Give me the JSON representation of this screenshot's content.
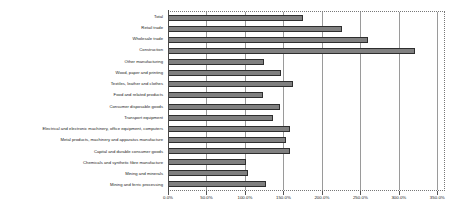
{
  "chart_data": {
    "type": "bar",
    "orientation": "horizontal",
    "title": "",
    "xlabel": "",
    "ylabel": "",
    "xlim": [
      0,
      360
    ],
    "grid": true,
    "legend": false,
    "tick_labels": [
      "0.0%",
      "50.0%",
      "100.0%",
      "150.0%",
      "200.0%",
      "250.0%",
      "300.0%",
      "350.0%"
    ],
    "ticks": [
      0,
      50,
      100,
      150,
      200,
      250,
      300,
      350
    ],
    "categories": [
      "Total",
      "Retail trade",
      "Wholesale trade",
      "Construction",
      "Other manufacturing",
      "Wood, paper and printing",
      "Textiles, leather and clothes",
      "Food and related products",
      "Consumer disposable goods",
      "Transport equipment",
      "Electrical and electronic machinery, office equipment, computers",
      "Metal products, machinery and apparatus manufacture",
      "Capital and durable consumer goods",
      "Chemicals and synthetic fibre manufacture",
      "Mining and minerals",
      "Mining and ferric processing"
    ],
    "values": [
      176,
      226,
      260,
      321,
      125,
      147,
      163,
      123,
      146,
      136,
      158,
      153,
      159,
      101,
      104,
      128
    ],
    "value_unit": "%",
    "colors": {
      "bar_fill": "#808080",
      "bar_border": "#2e2e2e",
      "gridline": "#9a9a9a",
      "axis": "#4a4a4a",
      "plot_border": "#777777",
      "text": "#222222",
      "background": "#ffffff"
    }
  }
}
